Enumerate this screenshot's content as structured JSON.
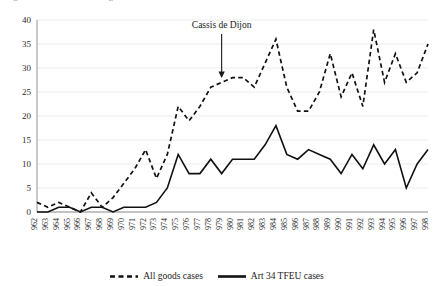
{
  "figure": {
    "caption_clipped": "Figure 1.  Free movement of goods cases before the Court of Justice",
    "annotation": {
      "label": "Cassis de Dijon",
      "target_year": "1979",
      "arrow_icon": "down-arrow-icon"
    }
  },
  "legend": {
    "position": "bottom-center",
    "items": [
      {
        "label": "All goods cases",
        "style": "dashed",
        "color": "#111111"
      },
      {
        "label": "Art 34 TFEU cases",
        "style": "solid",
        "color": "#111111"
      }
    ]
  },
  "chart_data": {
    "type": "line",
    "title": "",
    "subtitle": "",
    "xlabel": "",
    "ylabel": "",
    "ylim": [
      0,
      40
    ],
    "yticks": [
      0,
      5,
      10,
      15,
      20,
      25,
      30,
      35,
      40
    ],
    "grid": true,
    "grid_axis": "y",
    "legend_position": "bottom-center",
    "categories": [
      "1962",
      "1963",
      "1964",
      "1965",
      "1966",
      "1967",
      "1968",
      "1969",
      "1970",
      "1971",
      "1972",
      "1973",
      "1974",
      "1975",
      "1976",
      "1977",
      "1978",
      "1979",
      "1980",
      "1981",
      "1982",
      "1983",
      "1984",
      "1985",
      "1986",
      "1987",
      "1988",
      "1989",
      "1990",
      "1991",
      "1992",
      "1993",
      "1994",
      "1995",
      "1996",
      "1997",
      "1998"
    ],
    "series": [
      {
        "name": "All goods cases",
        "style": "dashed",
        "color": "#111111",
        "values": [
          2,
          1,
          2,
          1,
          0,
          4,
          1,
          3,
          6,
          9,
          13,
          7,
          12,
          22,
          19,
          22,
          26,
          27,
          28,
          28,
          26,
          31,
          36,
          26,
          21,
          21,
          25,
          33,
          24,
          29,
          22,
          38,
          27,
          33,
          27,
          29,
          35
        ]
      },
      {
        "name": "Art 34 TFEU cases",
        "style": "solid",
        "color": "#111111",
        "values": [
          0,
          0,
          1,
          1,
          0,
          1,
          1,
          0,
          1,
          1,
          1,
          2,
          5,
          12,
          8,
          8,
          11,
          8,
          11,
          11,
          11,
          14,
          18,
          12,
          11,
          13,
          12,
          11,
          8,
          12,
          9,
          14,
          10,
          13,
          5,
          10,
          13
        ]
      }
    ]
  }
}
